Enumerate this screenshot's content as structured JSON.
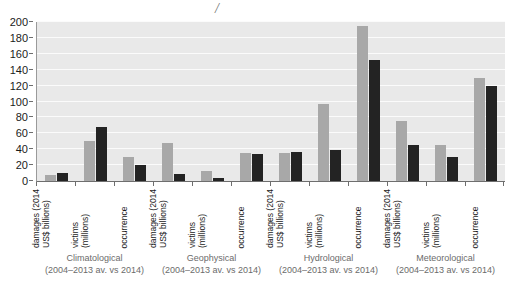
{
  "annotation": {
    "top_mark": "/"
  },
  "chart_data": {
    "type": "bar",
    "title": "",
    "subtitle": "",
    "xlabel": "",
    "ylabel": "",
    "ylim": [
      0,
      200
    ],
    "ytick_step": 20,
    "yticks": [
      0,
      20,
      40,
      60,
      80,
      100,
      120,
      140,
      160,
      180,
      200
    ],
    "grid": true,
    "legend_position": "none",
    "series": [
      {
        "name": "2004–2013 av.",
        "color": "#a8a8a8"
      },
      {
        "name": "2014",
        "color": "#232323"
      }
    ],
    "groups": [
      {
        "name": "Climatological",
        "period": "(2004–2013 av. vs 2014)",
        "categories": [
          "damages (2014 US$ billions)",
          "victims (millions)",
          "occurrence"
        ],
        "values_avg": [
          8,
          50,
          30
        ],
        "values_2014": [
          10,
          68,
          20
        ]
      },
      {
        "name": "Geophysical",
        "period": "(2004–2013 av. vs 2014)",
        "categories": [
          "damages (2014 US$ billions)",
          "victims (millions)",
          "occurrence"
        ],
        "values_avg": [
          48,
          12,
          35
        ],
        "values_2014": [
          9,
          4,
          34
        ]
      },
      {
        "name": "Hydrological",
        "period": "(2004–2013 av. vs 2014)",
        "categories": [
          "damages (2014 US$ billions)",
          "victims (millions)",
          "occurrence"
        ],
        "values_avg": [
          35,
          97,
          195
        ],
        "values_2014": [
          37,
          39,
          152
        ]
      },
      {
        "name": "Meteorological",
        "period": "(2004–2013 av. vs 2014)",
        "categories": [
          "damages (2014 US$ billions)",
          "victims (millions)",
          "occurrence"
        ],
        "values_avg": [
          75,
          45,
          130
        ],
        "values_2014": [
          45,
          30,
          120
        ]
      }
    ],
    "category_labels": {
      "damages_line1": "damages (2014",
      "damages_line2": "US$ billions)",
      "victims_line1": "victims",
      "victims_line2": "(millions)",
      "occurrence_line1": "occurrence",
      "occurrence_line2": ""
    }
  },
  "colors": {
    "plot_background": "#e9e9e9",
    "gridline": "#fbfbfb",
    "axis": "#6e6e6e",
    "bar_avg": "#a8a8a8",
    "bar_2014": "#232323",
    "tick_text": "#1b1b1b",
    "caption_text": "#6b6b6b"
  }
}
